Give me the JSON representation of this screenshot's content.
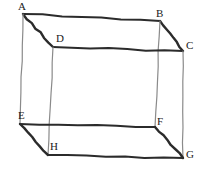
{
  "figure": {
    "name": "labeled-cuboid-diagram",
    "background_color": "#ffffff",
    "edge_color_dark": "#2b2b2b",
    "edge_color_light": "#8a8a8a",
    "label_color": "#1a1a1a",
    "vertices": [
      {
        "id": "A",
        "label": "A",
        "x": 23,
        "y": 14,
        "label_x": 18,
        "label_y": 1
      },
      {
        "id": "B",
        "label": "B",
        "x": 160,
        "y": 21,
        "label_x": 156,
        "label_y": 8
      },
      {
        "id": "C",
        "label": "C",
        "x": 183,
        "y": 51,
        "label_x": 186,
        "label_y": 40
      },
      {
        "id": "D",
        "label": "D",
        "x": 53,
        "y": 47,
        "label_x": 56,
        "label_y": 33
      },
      {
        "id": "E",
        "label": "E",
        "x": 20,
        "y": 124,
        "label_x": 18,
        "label_y": 110
      },
      {
        "id": "F",
        "label": "F",
        "x": 155,
        "y": 127,
        "label_x": 157,
        "label_y": 116
      },
      {
        "id": "G",
        "label": "G",
        "x": 183,
        "y": 158,
        "label_x": 186,
        "label_y": 149
      },
      {
        "id": "H",
        "label": "H",
        "x": 48,
        "y": 155,
        "label_x": 50,
        "label_y": 141
      }
    ],
    "edges": [
      {
        "id": "edge-AB",
        "from": "A",
        "to": "B",
        "style": "dark",
        "width": 2.0
      },
      {
        "id": "edge-AD",
        "from": "A",
        "to": "D",
        "style": "dark",
        "width": 2.4
      },
      {
        "id": "edge-AE",
        "from": "A",
        "to": "E",
        "style": "light",
        "width": 1.2
      },
      {
        "id": "edge-BC",
        "from": "B",
        "to": "C",
        "style": "dark",
        "width": 2.4
      },
      {
        "id": "edge-BF",
        "from": "B",
        "to": "F",
        "style": "light",
        "width": 1.2
      },
      {
        "id": "edge-DC",
        "from": "D",
        "to": "C",
        "style": "dark",
        "width": 2.0
      },
      {
        "id": "edge-DH",
        "from": "D",
        "to": "H",
        "style": "light",
        "width": 1.2
      },
      {
        "id": "edge-CG",
        "from": "C",
        "to": "G",
        "style": "light",
        "width": 1.2
      },
      {
        "id": "edge-EF",
        "from": "E",
        "to": "F",
        "style": "dark",
        "width": 2.0
      },
      {
        "id": "edge-EH",
        "from": "E",
        "to": "H",
        "style": "dark",
        "width": 2.4
      },
      {
        "id": "edge-FG",
        "from": "F",
        "to": "G",
        "style": "dark",
        "width": 2.4
      },
      {
        "id": "edge-HG",
        "from": "H",
        "to": "G",
        "style": "dark",
        "width": 2.0
      }
    ]
  }
}
